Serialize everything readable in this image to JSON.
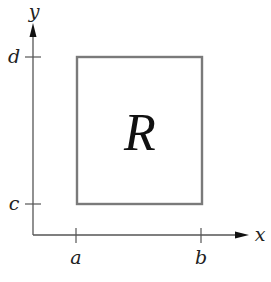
{
  "diagram": {
    "region_label": "R",
    "axes": {
      "x_label": "x",
      "y_label": "y"
    },
    "x_ticks": [
      {
        "label": "a"
      },
      {
        "label": "b"
      }
    ],
    "y_ticks": [
      {
        "label": "d"
      },
      {
        "label": "c"
      }
    ],
    "colors": {
      "axis": "#555555",
      "rectangle": "#7a7a7a",
      "text": "#222222"
    }
  }
}
